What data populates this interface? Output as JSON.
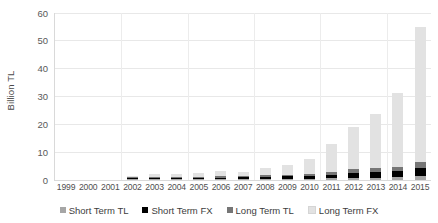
{
  "chart_data": {
    "type": "bar",
    "subtype": "stacked-column",
    "title": "",
    "xlabel": "",
    "ylabel": "Billion TL",
    "ylim": [
      0,
      60
    ],
    "yticks": [
      0,
      10,
      20,
      30,
      40,
      50,
      60
    ],
    "grid": true,
    "legend_position": "bottom",
    "categories": [
      "1999",
      "2000",
      "2001",
      "2002",
      "2003",
      "2004",
      "2005",
      "2006",
      "2007",
      "2008",
      "2009",
      "2010",
      "2011",
      "2012",
      "2013",
      "2014",
      "2015"
    ],
    "series": [
      {
        "name": "Short Term TL",
        "color": "#a6a6a6",
        "values": [
          0,
          0,
          0,
          0.1,
          0.1,
          0.1,
          0.1,
          0.1,
          0.1,
          0.2,
          0.2,
          0.3,
          0.4,
          0.5,
          0.6,
          0.8,
          1.2
        ]
      },
      {
        "name": "Short Term FX",
        "color": "#000000",
        "values": [
          0,
          0,
          0,
          0.1,
          0.2,
          0.2,
          0.3,
          0.4,
          0.5,
          0.7,
          0.8,
          1.0,
          1.4,
          2.0,
          2.0,
          2.2,
          2.8
        ]
      },
      {
        "name": "Long Term TL",
        "color": "#767676",
        "values": [
          0,
          0,
          0,
          0.1,
          0.2,
          0.2,
          0.3,
          0.4,
          0.4,
          0.5,
          0.6,
          0.8,
          1.0,
          1.2,
          1.4,
          1.6,
          2.2
        ]
      },
      {
        "name": "Long Term FX",
        "color": "#e2e2e2",
        "values": [
          0,
          0,
          0,
          0.5,
          1.2,
          1.0,
          1.5,
          2.0,
          1.6,
          2.8,
          3.5,
          5.2,
          9.8,
          15.0,
          19.5,
          26.5,
          48.5
        ]
      }
    ],
    "totals": [
      0,
      0,
      0,
      0.8,
      1.7,
      1.5,
      2.2,
      2.9,
      2.6,
      4.2,
      5.1,
      7.3,
      12.6,
      18.7,
      23.5,
      31.1,
      54.7
    ]
  },
  "axis": {
    "y_title": "Billion TL",
    "y_ticks": [
      "60",
      "50",
      "40",
      "30",
      "20",
      "10",
      "0"
    ],
    "x_ticks": [
      "1999",
      "2000",
      "2001",
      "2002",
      "2003",
      "2004",
      "2005",
      "2006",
      "2007",
      "2008",
      "2009",
      "2010",
      "2011",
      "2012",
      "2013",
      "2014",
      "2015"
    ]
  },
  "legend": {
    "items": [
      {
        "label": "Short Term TL",
        "color": "#a6a6a6"
      },
      {
        "label": "Short Term FX",
        "color": "#000000"
      },
      {
        "label": "Long Term TL",
        "color": "#767676"
      },
      {
        "label": "Long Term FX",
        "color": "#e2e2e2"
      }
    ]
  }
}
